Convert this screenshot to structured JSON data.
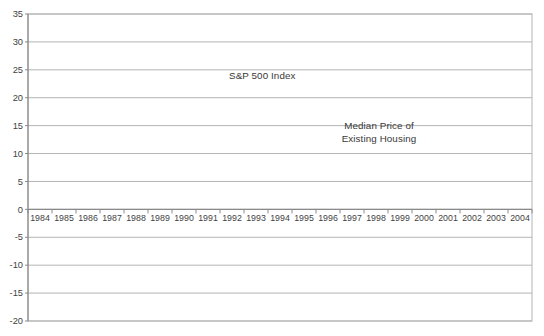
{
  "chart_data": {
    "type": "line",
    "title": "",
    "xlabel": "",
    "ylabel": "",
    "x": [
      "1984",
      "1985",
      "1986",
      "1987",
      "1988",
      "1989",
      "1990",
      "1991",
      "1992",
      "1993",
      "1994",
      "1995",
      "1996",
      "1997",
      "1998",
      "1999",
      "2000",
      "2001",
      "2002",
      "2003",
      "2004"
    ],
    "ylim": [
      -20,
      35
    ],
    "ytick_step": 5,
    "grid": true,
    "legend_position": "none (in-plot text labels with arrows)",
    "series": [
      {
        "name": "S&P 500 Index",
        "marker": "square",
        "values": [
          1.4,
          15.6,
          27.6,
          21.2,
          -6.7,
          20.6,
          4.9,
          12.0,
          11.4,
          8.5,
          2.0,
          16.6,
          24.8,
          29.0,
          24.7,
          23.3,
          9.6,
          -16.2,
          -15.7,
          -5.8,
          19.0
        ]
      },
      {
        "name": "Median Price of Existing Housing",
        "marker": "diamond",
        "values": [
          4.7,
          6.1,
          7.7,
          7.9,
          6.6,
          6.2,
          2.9,
          1.4,
          2.1,
          1.7,
          1.7,
          2.7,
          3.5,
          3.5,
          5.3,
          5.2,
          7.3,
          8.1,
          7.2,
          7.2,
          9.0
        ]
      }
    ],
    "annotations": [
      {
        "text": "S&P 500 Index",
        "lines": [
          "S&P 500 Index"
        ],
        "arrow": {
          "x1": 256,
          "y1": 85,
          "x2": 308,
          "y2": 103
        }
      },
      {
        "text": "Median Price of Existing Housing",
        "lines": [
          "Median Price of",
          "Existing Housing"
        ],
        "arrow": {
          "x1": 380,
          "y1": 151,
          "x2": 386,
          "y2": 172
        }
      }
    ],
    "colors": {
      "series_line": "#282828",
      "marker": "#282828",
      "grid": "#b4b4b4",
      "axis": "#8a8a8a",
      "tick_text": "#3f3f3f",
      "annotation_text": "#383838",
      "arrow": "#4a4a4a",
      "background": "#ffffff"
    }
  }
}
